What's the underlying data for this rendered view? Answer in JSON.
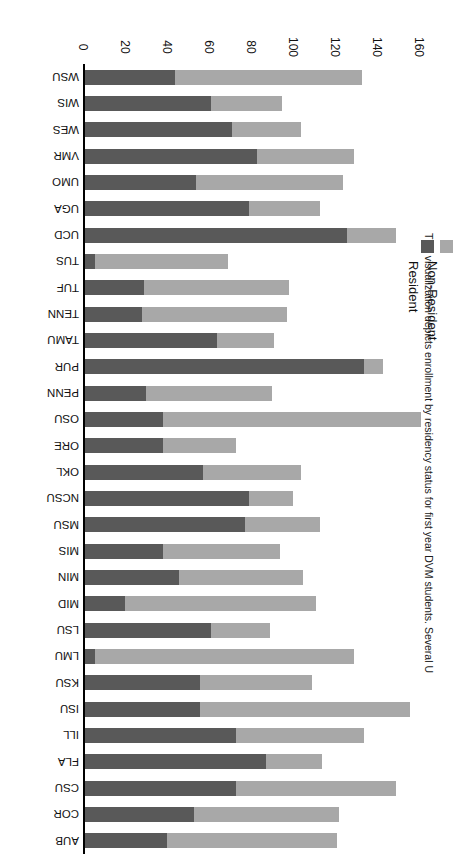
{
  "caption": "This visualization depicts enrollment by residency status for first year DVM students. Several US colleges of veterinary",
  "legend": {
    "position": "left",
    "items": [
      {
        "label": "Non-Resident",
        "color": "#a8a8a8"
      },
      {
        "label": "Resident",
        "color": "#595959"
      }
    ]
  },
  "chart_data": {
    "type": "bar",
    "orientation": "horizontal",
    "stacked": true,
    "title": "",
    "xlabel": "",
    "ylabel": "",
    "xlim": [
      0,
      160
    ],
    "xticks": [
      0,
      20,
      40,
      60,
      80,
      100,
      120,
      140,
      160
    ],
    "grid": false,
    "legend_position": "left",
    "categories": [
      "AUB",
      "COR",
      "CSU",
      "FLA",
      "ILL",
      "ISU",
      "KSU",
      "LMU",
      "LSU",
      "MID",
      "MIN",
      "MIS",
      "MSU",
      "NCSU",
      "OKL",
      "ORE",
      "OSU",
      "PENN",
      "PUR",
      "TAMU",
      "TENN",
      "TUF",
      "TUS",
      "UCD",
      "UGA",
      "UMO",
      "VMR",
      "WES",
      "WIS",
      "WSU"
    ],
    "series": [
      {
        "name": "Resident",
        "color": "#595959",
        "values": [
          39,
          52,
          72,
          86,
          72,
          55,
          55,
          5,
          60,
          19,
          45,
          37,
          76,
          78,
          56,
          37,
          37,
          29,
          133,
          63,
          27,
          28,
          5,
          125,
          78,
          53,
          82,
          70,
          60,
          43
        ]
      },
      {
        "name": "Non-Resident",
        "color": "#a8a8a8",
        "values": [
          81,
          69,
          76,
          27,
          61,
          100,
          53,
          123,
          28,
          91,
          59,
          56,
          36,
          21,
          47,
          35,
          123,
          60,
          9,
          27,
          69,
          69,
          63,
          23,
          34,
          70,
          46,
          33,
          34,
          89
        ]
      }
    ],
    "totals": [
      120,
      121,
      148,
      113,
      133,
      155,
      108,
      128,
      88,
      110,
      104,
      93,
      112,
      99,
      103,
      72,
      160,
      89,
      142,
      90,
      96,
      97,
      68,
      148,
      112,
      123,
      128,
      103,
      94,
      132
    ]
  }
}
